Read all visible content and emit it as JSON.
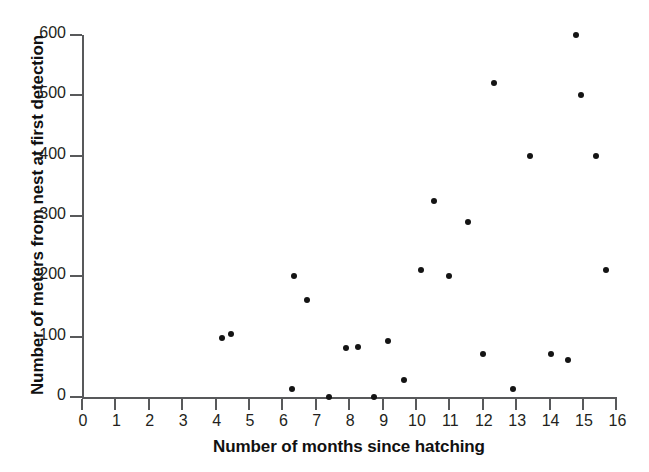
{
  "chart_data": {
    "type": "scatter",
    "title": "",
    "xlabel": "Number of months since hatching",
    "ylabel": "Number of meters from nest at first detection",
    "xlim": [
      0,
      16
    ],
    "ylim": [
      0,
      600
    ],
    "xticks": [
      0,
      1,
      2,
      3,
      4,
      5,
      6,
      7,
      8,
      9,
      10,
      11,
      12,
      13,
      14,
      15,
      16
    ],
    "yticks": [
      0,
      100,
      200,
      300,
      400,
      500,
      600
    ],
    "xtick_labels": [
      "0",
      "1",
      "2",
      "3",
      "4",
      "5",
      "6",
      "7",
      "8",
      "9",
      "10",
      "11",
      "12",
      "13",
      "14",
      "15",
      "16"
    ],
    "ytick_labels": [
      "0",
      "100",
      "200",
      "300",
      "400",
      "500",
      "600"
    ],
    "grid": false,
    "legend": null,
    "marker": "circle",
    "marker_color": "#141414",
    "axis_color": "#58595b",
    "background_color": "#ffffff",
    "points": [
      {
        "x": 4.2,
        "y": 98
      },
      {
        "x": 4.45,
        "y": 104
      },
      {
        "x": 6.3,
        "y": 13
      },
      {
        "x": 6.35,
        "y": 200
      },
      {
        "x": 6.75,
        "y": 160
      },
      {
        "x": 7.4,
        "y": 0
      },
      {
        "x": 7.9,
        "y": 82
      },
      {
        "x": 8.25,
        "y": 83
      },
      {
        "x": 8.75,
        "y": 0
      },
      {
        "x": 9.15,
        "y": 93
      },
      {
        "x": 9.65,
        "y": 29
      },
      {
        "x": 10.15,
        "y": 210
      },
      {
        "x": 10.55,
        "y": 325
      },
      {
        "x": 11.0,
        "y": 200
      },
      {
        "x": 11.55,
        "y": 290
      },
      {
        "x": 12.0,
        "y": 72
      },
      {
        "x": 12.35,
        "y": 520
      },
      {
        "x": 12.9,
        "y": 13
      },
      {
        "x": 13.4,
        "y": 400
      },
      {
        "x": 14.05,
        "y": 72
      },
      {
        "x": 14.55,
        "y": 62
      },
      {
        "x": 14.8,
        "y": 600
      },
      {
        "x": 14.95,
        "y": 500
      },
      {
        "x": 15.4,
        "y": 400
      },
      {
        "x": 15.7,
        "y": 210
      }
    ]
  },
  "plot_geometry": {
    "origin_x": 82,
    "origin_y": 397,
    "px_per_x_unit": 33.4,
    "px_per_y_unit": 0.6033
  }
}
